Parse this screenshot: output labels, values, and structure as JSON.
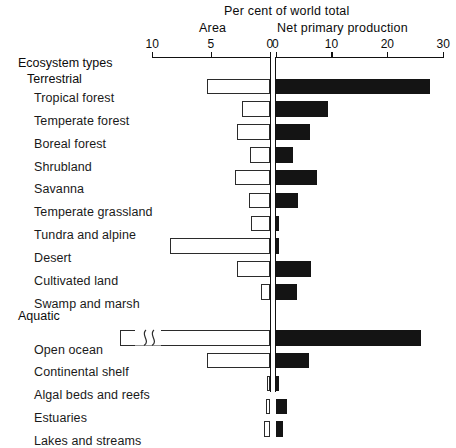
{
  "titles": {
    "main": "Per cent of world total",
    "left_panel": "Area",
    "right_panel": "Net primary production"
  },
  "axis": {
    "left_ticks": [
      "10",
      "5",
      "0"
    ],
    "right_ticks": [
      "0",
      "10",
      "20",
      "30"
    ],
    "left_max": 10,
    "right_max": 30
  },
  "headers": {
    "ecosystem_types": "Ecosystem types",
    "terrestrial": "Terrestrial",
    "aquatic": "Aquatic"
  },
  "chart_data": {
    "type": "bar",
    "title": "Per cent of world total",
    "orientation": "horizontal",
    "layout": "bidirectional-pyramid",
    "xlabel": "Per cent of world total",
    "ylabel": "Ecosystem types",
    "grid": false,
    "legend": false,
    "axes": [
      {
        "name": "Area",
        "side": "left",
        "range": [
          0,
          10
        ],
        "ticks": [
          0,
          5,
          10
        ],
        "direction": "reversed"
      },
      {
        "name": "Net primary production",
        "side": "right",
        "range": [
          0,
          30
        ],
        "ticks": [
          0,
          10,
          20,
          30
        ],
        "direction": "normal"
      }
    ],
    "groups": [
      {
        "name": "Terrestrial",
        "categories": [
          "Tropical forest",
          "Temperate forest",
          "Boreal forest",
          "Shrubland",
          "Savanna",
          "Temperate grassland",
          "Tundra and alpine",
          "Desert",
          "Cultivated land",
          "Swamp and marsh"
        ]
      },
      {
        "name": "Aquatic",
        "categories": [
          "Open ocean",
          "Continental shelf",
          "Algal beds and reefs",
          "Estuaries",
          "Lakes and streams"
        ]
      }
    ],
    "categories": [
      "Tropical forest",
      "Temperate forest",
      "Boreal forest",
      "Shrubland",
      "Savanna",
      "Temperate grassland",
      "Tundra and alpine",
      "Desert",
      "Cultivated land",
      "Swamp and marsh",
      "Open ocean",
      "Continental shelf",
      "Algal beds and reefs",
      "Estuaries",
      "Lakes and streams"
    ],
    "series": [
      {
        "name": "Area",
        "axis": "left",
        "values": [
          5.3,
          2.4,
          2.8,
          1.7,
          3.0,
          1.8,
          1.6,
          8.5,
          2.8,
          0.8,
          65.0,
          5.3,
          0.1,
          0.3,
          0.5
        ]
      },
      {
        "name": "Net primary production",
        "axis": "right",
        "values": [
          27.7,
          9.4,
          6.2,
          3.2,
          7.5,
          4.1,
          0.6,
          0.7,
          6.4,
          3.9,
          26.0,
          6.0,
          0.6,
          2.0,
          1.3
        ]
      }
    ],
    "annotations": [
      {
        "category": "Open ocean",
        "series": "Area",
        "note": "axis break — bar truncated, actual value far exceeds scale"
      }
    ]
  },
  "rows": [
    {
      "label": "Tropical forest",
      "area": 5.3,
      "npp": 27.7,
      "broken": false
    },
    {
      "label": "Temperate forest",
      "area": 2.4,
      "npp": 9.4,
      "broken": false
    },
    {
      "label": "Boreal forest",
      "area": 2.8,
      "npp": 6.2,
      "broken": false
    },
    {
      "label": "Shrubland",
      "area": 1.7,
      "npp": 3.2,
      "broken": false
    },
    {
      "label": "Savanna",
      "area": 3.0,
      "npp": 7.5,
      "broken": false
    },
    {
      "label": "Temperate grassland",
      "area": 1.8,
      "npp": 4.1,
      "broken": false
    },
    {
      "label": "Tundra and alpine",
      "area": 1.6,
      "npp": 0.6,
      "broken": false
    },
    {
      "label": "Desert",
      "area": 8.5,
      "npp": 0.7,
      "broken": false
    },
    {
      "label": "Cultivated land",
      "area": 2.8,
      "npp": 6.4,
      "broken": false
    },
    {
      "label": "Swamp and marsh",
      "area": 0.8,
      "npp": 3.9,
      "broken": false
    },
    {
      "label": "Open ocean",
      "area": 65.0,
      "npp": 26.0,
      "broken": true
    },
    {
      "label": "Continental shelf",
      "area": 5.3,
      "npp": 6.0,
      "broken": false
    },
    {
      "label": "Algal beds and reefs",
      "area": 0.1,
      "npp": 0.6,
      "broken": false
    },
    {
      "label": "Estuaries",
      "area": 0.3,
      "npp": 2.0,
      "broken": false
    },
    {
      "label": "Lakes and streams",
      "area": 0.5,
      "npp": 1.3,
      "broken": false
    }
  ],
  "colors": {
    "bar_fill_npp": "#141414",
    "bar_outline_area": "#2b2b2b",
    "axis": "#111111",
    "background": "#ffffff"
  }
}
